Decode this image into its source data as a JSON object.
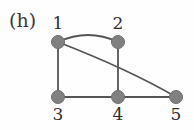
{
  "figure": {
    "panel_label": "(h)",
    "width": 194,
    "height": 130,
    "background_color": "#fefefe",
    "vertex_color": "#808080",
    "vertex_stroke_color": "#6f6f6f",
    "edge_color": "#555555",
    "label_color": "#2e2e2e"
  },
  "chart_data": {
    "type": "diagram",
    "subtype": "undirected-graph",
    "title": "(h)",
    "nodes": [
      {
        "id": "1",
        "label": "1",
        "x": 58,
        "y": 42,
        "r": 6.5,
        "label_x": 58,
        "label_y": 23
      },
      {
        "id": "2",
        "label": "2",
        "x": 118,
        "y": 42,
        "r": 6.5,
        "label_x": 118,
        "label_y": 23
      },
      {
        "id": "3",
        "label": "3",
        "x": 58,
        "y": 97,
        "r": 6.5,
        "label_x": 58,
        "label_y": 114
      },
      {
        "id": "4",
        "label": "4",
        "x": 118,
        "y": 97,
        "r": 6.5,
        "label_x": 118,
        "label_y": 114
      },
      {
        "id": "5",
        "label": "5",
        "x": 176,
        "y": 97,
        "r": 6.5,
        "label_x": 176,
        "label_y": 114
      }
    ],
    "edges": [
      {
        "source": "1",
        "target": "2",
        "shape": "curve",
        "bend": "up",
        "path": "M 58 42 Q 88 28 118 42"
      },
      {
        "source": "1",
        "target": "3",
        "shape": "straight",
        "path": "M 58 42 L 58 97"
      },
      {
        "source": "2",
        "target": "4",
        "shape": "straight",
        "path": "M 118 42 L 118 97"
      },
      {
        "source": "3",
        "target": "4",
        "shape": "straight",
        "path": "M 58 97 L 118 97"
      },
      {
        "source": "4",
        "target": "5",
        "shape": "straight",
        "path": "M 118 97 L 176 97"
      },
      {
        "source": "1",
        "target": "5",
        "shape": "curve",
        "bend": "down",
        "path": "M 58 42 Q 130 70 176 97"
      }
    ],
    "node_count": 5,
    "edge_count": 6,
    "edge_list_text": "1-2, 1-3, 1-5, 2-4, 3-4, 4-5"
  }
}
